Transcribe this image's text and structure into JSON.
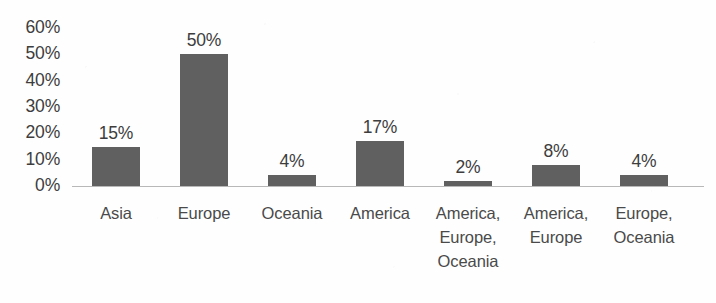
{
  "chart_data": {
    "type": "bar",
    "title": "",
    "xlabel": "",
    "ylabel": "",
    "categories": [
      "Asia",
      "Europe",
      "Oceania",
      "America",
      "America, Europe, Oceania",
      "America, Europe",
      "Europe, Oceania"
    ],
    "category_lines": [
      [
        "Asia"
      ],
      [
        "Europe"
      ],
      [
        "Oceania"
      ],
      [
        "America"
      ],
      [
        "America,",
        "Europe,",
        "Oceania"
      ],
      [
        "America,",
        "Europe"
      ],
      [
        "Europe,",
        "Oceania"
      ]
    ],
    "values": [
      15,
      50,
      4,
      17,
      2,
      8,
      4
    ],
    "value_labels": [
      "15%",
      "50%",
      "4%",
      "17%",
      "2%",
      "8%",
      "4%"
    ],
    "ylim": [
      0,
      60
    ],
    "ytick_values": [
      60,
      50,
      40,
      30,
      20,
      10,
      0
    ],
    "ytick_labels": [
      "60%",
      "50%",
      "40%",
      "30%",
      "20%",
      "10%",
      "0%"
    ],
    "grid": false,
    "legend": false,
    "bar_color": "#606060",
    "axis_color": "#b8b8b8",
    "text_color": "#3d3d3d"
  }
}
